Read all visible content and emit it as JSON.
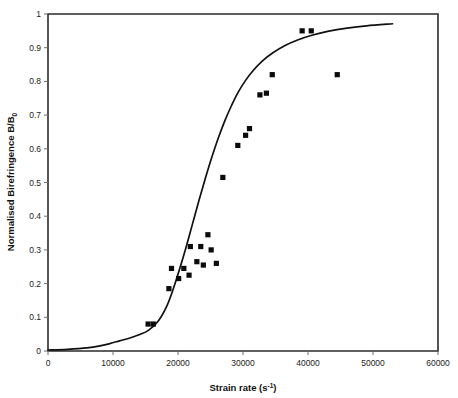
{
  "chart_data": {
    "type": "scatter",
    "title": "",
    "subtitle": "",
    "xlabel": "Strain rate (s⁻¹)",
    "xlabel_base": "Strain rate (s",
    "xlabel_exponent": "-1",
    "xlabel_close": ")",
    "ylabel": "Normalised Birefringence B/B₀",
    "ylabel_base": "Normalised Birefringence B/B",
    "ylabel_subscript": "0",
    "xlim": [
      0,
      60000
    ],
    "ylim": [
      0,
      1
    ],
    "xticks": [
      0,
      10000,
      20000,
      30000,
      40000,
      50000,
      60000
    ],
    "xticklabels": [
      "0",
      "10000",
      "20000",
      "30000",
      "40000",
      "50000",
      "60000"
    ],
    "yticks": [
      0,
      0.1,
      0.2,
      0.3,
      0.4,
      0.5,
      0.6,
      0.7,
      0.8,
      0.9,
      1
    ],
    "yticklabels": [
      "0",
      "0.1",
      "0.2",
      "0.3",
      "0.4",
      "0.5",
      "0.6",
      "0.7",
      "0.8",
      "0.9",
      "1"
    ],
    "grid": false,
    "legend": false,
    "legend_position": "none",
    "marker_color": "#0b0b0b",
    "curve_color": "#111111",
    "axis_color": "#2b2b2b",
    "series": [
      {
        "name": "Measured data",
        "type": "scatter",
        "marker": "square",
        "points": [
          [
            15400,
            0.08
          ],
          [
            16200,
            0.08
          ],
          [
            18600,
            0.185
          ],
          [
            19000,
            0.245
          ],
          [
            20100,
            0.215
          ],
          [
            20900,
            0.245
          ],
          [
            21700,
            0.225
          ],
          [
            21900,
            0.31
          ],
          [
            22900,
            0.265
          ],
          [
            23500,
            0.31
          ],
          [
            23900,
            0.255
          ],
          [
            24600,
            0.345
          ],
          [
            25100,
            0.3
          ],
          [
            25900,
            0.26
          ],
          [
            26900,
            0.515
          ],
          [
            29200,
            0.61
          ],
          [
            30400,
            0.64
          ],
          [
            31000,
            0.66
          ],
          [
            32600,
            0.76
          ],
          [
            33600,
            0.765
          ],
          [
            34500,
            0.82
          ],
          [
            39100,
            0.95
          ],
          [
            40500,
            0.95
          ],
          [
            44500,
            0.82
          ]
        ]
      },
      {
        "name": "Model fit",
        "type": "line",
        "points": [
          [
            0,
            0.003
          ],
          [
            3000,
            0.005
          ],
          [
            6000,
            0.009
          ],
          [
            8000,
            0.015
          ],
          [
            9500,
            0.022
          ],
          [
            11000,
            0.03
          ],
          [
            12500,
            0.038
          ],
          [
            14000,
            0.048
          ],
          [
            15500,
            0.062
          ],
          [
            17000,
            0.09
          ],
          [
            18200,
            0.13
          ],
          [
            19200,
            0.18
          ],
          [
            20200,
            0.24
          ],
          [
            21200,
            0.305
          ],
          [
            22200,
            0.375
          ],
          [
            23200,
            0.445
          ],
          [
            24200,
            0.512
          ],
          [
            25200,
            0.575
          ],
          [
            26200,
            0.632
          ],
          [
            27200,
            0.683
          ],
          [
            28200,
            0.727
          ],
          [
            29200,
            0.766
          ],
          [
            30400,
            0.803
          ],
          [
            31600,
            0.833
          ],
          [
            33000,
            0.861
          ],
          [
            34600,
            0.885
          ],
          [
            36400,
            0.906
          ],
          [
            38400,
            0.923
          ],
          [
            40600,
            0.937
          ],
          [
            43200,
            0.949
          ],
          [
            46000,
            0.958
          ],
          [
            49000,
            0.965
          ],
          [
            53000,
            0.971
          ]
        ]
      }
    ]
  }
}
